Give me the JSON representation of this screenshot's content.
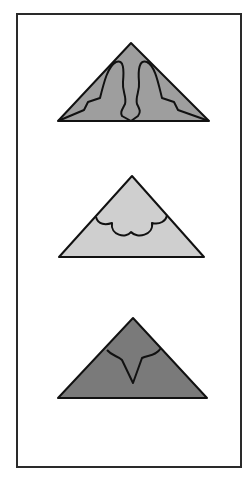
{
  "figure": {
    "frame_color": "#2a2a2a",
    "panels": [
      {
        "id": "triangle-1",
        "fill": "#9e9e9e",
        "pattern": "double-arch cut with zigzag edges"
      },
      {
        "id": "triangle-2",
        "fill": "#cfcfcf",
        "pattern": "scalloped cloud cut"
      },
      {
        "id": "triangle-3",
        "fill": "#7a7a7a",
        "pattern": "arc with V-notch cut"
      }
    ]
  }
}
